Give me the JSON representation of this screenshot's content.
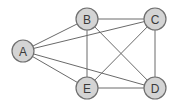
{
  "diagram": {
    "type": "undirected-graph",
    "colors": {
      "background": "#ffffff",
      "node_fill": "#d4d4d4",
      "node_stroke": "#6f6f6f",
      "edge": "#6a6a6a",
      "label": "#3a3a3a"
    },
    "node_radius": 11,
    "nodes": [
      {
        "id": "A",
        "label": "A",
        "x": 23,
        "y": 51
      },
      {
        "id": "B",
        "label": "B",
        "x": 87,
        "y": 19
      },
      {
        "id": "C",
        "label": "C",
        "x": 155,
        "y": 19
      },
      {
        "id": "E",
        "label": "E",
        "x": 87,
        "y": 88
      },
      {
        "id": "D",
        "label": "D",
        "x": 155,
        "y": 88
      }
    ],
    "edges": [
      [
        "A",
        "B"
      ],
      [
        "A",
        "C"
      ],
      [
        "A",
        "E"
      ],
      [
        "A",
        "D"
      ],
      [
        "B",
        "C"
      ],
      [
        "B",
        "E"
      ],
      [
        "B",
        "D"
      ],
      [
        "C",
        "E"
      ],
      [
        "C",
        "D"
      ],
      [
        "E",
        "D"
      ]
    ]
  }
}
